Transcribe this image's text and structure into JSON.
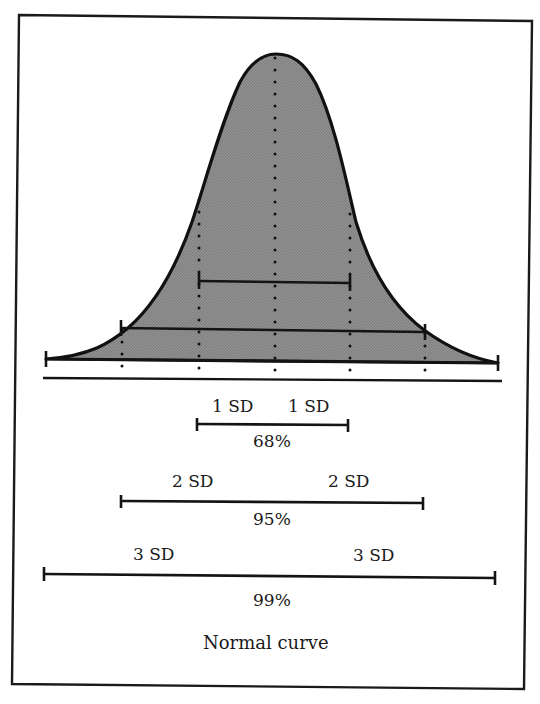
{
  "figure": {
    "caption": "Normal curve",
    "fill_color": "#8e8e8e",
    "line_color": "#111111"
  },
  "ranges": [
    {
      "id": "1sd",
      "left_label": "1 SD",
      "right_label": "1 SD",
      "percent": "68%"
    },
    {
      "id": "2sd",
      "left_label": "2 SD",
      "right_label": "2 SD",
      "percent": "95%"
    },
    {
      "id": "3sd",
      "left_label": "3 SD",
      "right_label": "3 SD",
      "percent": "99%"
    }
  ],
  "chart_data": {
    "type": "area",
    "title": "Normal curve",
    "xlabel": "",
    "ylabel": "",
    "x_ticks_sd": [
      -3,
      -2,
      -1,
      0,
      1,
      2,
      3
    ],
    "annotations": [
      {
        "range_sd": [
          -1,
          1
        ],
        "label": "1 SD | 1 SD",
        "percent": 68
      },
      {
        "range_sd": [
          -2,
          2
        ],
        "label": "2 SD | 2 SD",
        "percent": 95
      },
      {
        "range_sd": [
          -3,
          3
        ],
        "label": "3 SD | 3 SD",
        "percent": 99
      }
    ],
    "grid": false,
    "legend": "none"
  }
}
